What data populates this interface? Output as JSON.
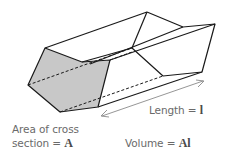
{
  "diagram": {
    "labels": {
      "area_line1": "Area of cross",
      "area_line2_text": "section = ",
      "area_symbol": "A",
      "length_text": "Length = ",
      "length_symbol": "l",
      "volume_text": "Volume = ",
      "volume_symbol": "Al"
    },
    "colors": {
      "cross_section_fill": "#c8c8c8",
      "edge": "#1a1a1a",
      "text": "#6a6a6a"
    }
  }
}
